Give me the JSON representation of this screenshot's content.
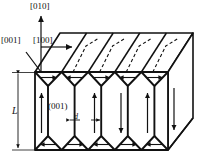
{
  "figure": {
    "type": "crystal-domain-structure-diagram",
    "background_color": "#ffffff",
    "line_color": "#111111",
    "face_color": "#ffffff"
  },
  "axes": {
    "vertical": {
      "label": "[010]",
      "direction": "up"
    },
    "depth": {
      "label": "[001]",
      "direction": "up-left-diagonal"
    },
    "horizontal": {
      "label": "[100]",
      "direction": "right"
    }
  },
  "dimensions": {
    "height": {
      "label": "L",
      "style": "italic",
      "arrow": "double-headed-vertical"
    },
    "domain_width": {
      "label": "d",
      "style": "italic",
      "arrow": "double-headed-horizontal"
    }
  },
  "plane_label": {
    "label": "(001)"
  },
  "domains": {
    "count": 5,
    "polarization_arrows": [
      "up",
      "up",
      "down",
      "up",
      "down"
    ],
    "top_edge_arrows": [
      "right",
      "left",
      "right",
      "left",
      "right"
    ],
    "bottom_edge_arrows": [
      "left",
      "right",
      "left",
      "right",
      "left"
    ],
    "wall_type": "zigzag"
  },
  "hidden_edges": {
    "style": "dashed",
    "count": 4
  }
}
